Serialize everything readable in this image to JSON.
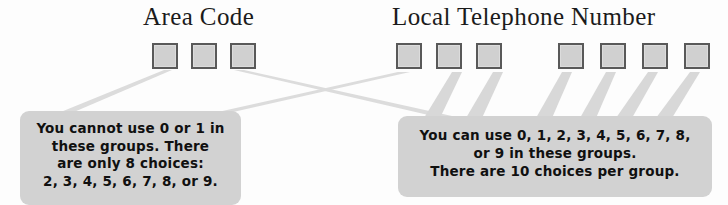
{
  "figure": {
    "background_color": "#fdfdfd"
  },
  "headings": {
    "area_code": "Area Code",
    "local_number": "Local Telephone Number"
  },
  "digit_groups": [
    {
      "name": "area-code",
      "label": "Area Code",
      "box_count": 3,
      "choices_per_box": 8,
      "allowed_digits": [
        2,
        3,
        4,
        5,
        6,
        7,
        8,
        9
      ]
    },
    {
      "name": "prefix",
      "label": "Prefix",
      "box_count": 3,
      "choices_per_box": 10,
      "allowed_digits": [
        0,
        1,
        2,
        3,
        4,
        5,
        6,
        7,
        8,
        9
      ]
    },
    {
      "name": "line-number",
      "label": "Line Number",
      "box_count": 4,
      "choices_per_box": 10,
      "allowed_digits": [
        0,
        1,
        2,
        3,
        4,
        5,
        6,
        7,
        8,
        9
      ]
    }
  ],
  "callouts": {
    "area_code": {
      "lines": [
        "You cannot use 0 or 1 in",
        "these groups. There",
        "are only 8 choices:",
        "2, 3, 4, 5, 6, 7, 8, or 9."
      ],
      "fill_color": "#d2d2d2"
    },
    "local_number": {
      "lines": [
        "You can use 0, 1, 2, 3, 4, 5, 6, 7, 8,",
        "or 9 in these groups.",
        "There are 10 choices per group."
      ],
      "fill_color": "#d2d2d2"
    }
  },
  "colors": {
    "box_fill": "#d0d0d0",
    "box_border": "#595959",
    "connector": "#d8d8d8",
    "text": "#101010",
    "heading_text": "#1b1b1b"
  }
}
